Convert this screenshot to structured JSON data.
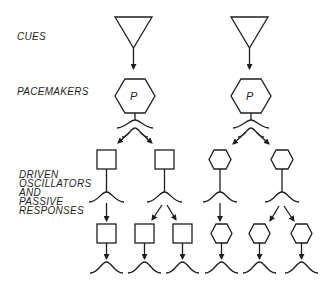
{
  "diagram": {
    "labels": {
      "cues": "CUES",
      "pacemakers": "PACEMAKERS",
      "driven": [
        "DRIVEN",
        "OSCILLATORS",
        "AND",
        "PASSIVE",
        "RESPONSES"
      ]
    },
    "pacemaker_symbol": "P",
    "colors": {
      "stroke": "#1e1e1e",
      "background": "#ffffff"
    },
    "left_hierarchy": {
      "cue": "triangle",
      "pacemaker": "hexagon",
      "tier1_nodes": [
        "square",
        "square"
      ],
      "tier2_nodes": [
        "square",
        "square",
        "square"
      ]
    },
    "right_hierarchy": {
      "cue": "triangle",
      "pacemaker": "hexagon",
      "tier1_nodes": [
        "hexagon",
        "hexagon"
      ],
      "tier2_nodes": [
        "hexagon",
        "hexagon",
        "hexagon"
      ]
    }
  }
}
